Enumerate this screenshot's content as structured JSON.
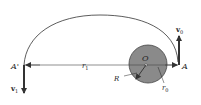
{
  "diagram": {
    "type": "orbital-transfer",
    "labels": {
      "point_start": "A",
      "point_end": "A'",
      "center": "O",
      "planet_radius": "R",
      "radius_start": "r",
      "radius_start_sub": "0",
      "radius_end": "r",
      "radius_end_sub": "1",
      "velocity_start": "v",
      "velocity_start_sub": "0",
      "velocity_end": "v",
      "velocity_end_sub": "1"
    },
    "colors": {
      "planet_fill": "#8a8a8a",
      "planet_stroke": "#444444",
      "line": "#333333",
      "background": "#ffffff"
    }
  }
}
